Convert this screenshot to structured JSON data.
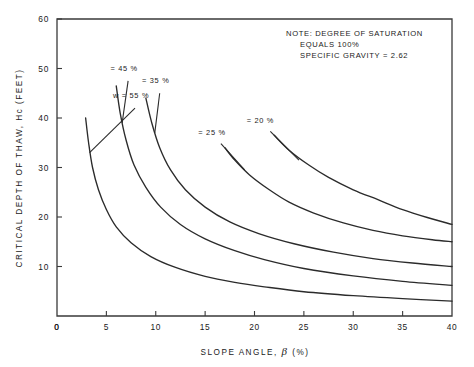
{
  "chart_data": {
    "type": "line",
    "title": "",
    "xlabel": "SLOPE ANGLE, β (%)",
    "ylabel": "CRITICAL DEPTH OF THAW, Hc (FEET)",
    "xlim": [
      0,
      40
    ],
    "ylim": [
      0,
      60
    ],
    "xticks": [
      0,
      5,
      10,
      15,
      20,
      25,
      30,
      35,
      40
    ],
    "xticklabels": [
      "0",
      "5",
      "10",
      "15",
      "20",
      "25",
      "30",
      "35",
      "40"
    ],
    "yticks": [
      0,
      10,
      20,
      30,
      40,
      50,
      60
    ],
    "yticklabels": [
      "0",
      "10",
      "20",
      "30",
      "40",
      "50",
      "60"
    ],
    "grid": false,
    "legend_position": "inline-curve-labels",
    "annotations": [
      "NOTE: DEGREE OF SATURATION",
      "EQUALS 100%",
      "SPECIFIC GRAVITY = 2.62"
    ],
    "series": [
      {
        "name": "w=55 %",
        "label": "w = 55 %",
        "label_x": 7.5,
        "label_y": 44.0,
        "points": [
          [
            2.9,
            40.0
          ],
          [
            3.2,
            35.0
          ],
          [
            3.6,
            30.0
          ],
          [
            4.2,
            25.5
          ],
          [
            5.0,
            21.5
          ],
          [
            6.0,
            18.0
          ],
          [
            7.5,
            14.8
          ],
          [
            9.5,
            12.0
          ],
          [
            12.0,
            9.8
          ],
          [
            15.0,
            8.0
          ],
          [
            18.0,
            6.8
          ],
          [
            21.0,
            5.9
          ],
          [
            25.0,
            4.9
          ],
          [
            30.0,
            4.1
          ],
          [
            35.0,
            3.5
          ],
          [
            40.0,
            3.0
          ]
        ]
      },
      {
        "name": "=45 %",
        "label": "= 45 %",
        "label_x": 6.8,
        "label_y": 49.5,
        "points": [
          [
            6.0,
            46.5
          ],
          [
            6.4,
            41.0
          ],
          [
            7.0,
            35.5
          ],
          [
            7.8,
            30.5
          ],
          [
            9.0,
            26.0
          ],
          [
            10.5,
            22.0
          ],
          [
            12.5,
            18.5
          ],
          [
            15.0,
            15.6
          ],
          [
            18.0,
            13.2
          ],
          [
            21.0,
            11.4
          ],
          [
            25.0,
            9.6
          ],
          [
            30.0,
            8.1
          ],
          [
            35.0,
            7.0
          ],
          [
            40.0,
            6.2
          ]
        ]
      },
      {
        "name": "=35 %",
        "label": "= 35 %",
        "label_x": 10.0,
        "label_y": 47.0,
        "points": [
          [
            9.0,
            44.0
          ],
          [
            9.6,
            39.0
          ],
          [
            10.4,
            34.0
          ],
          [
            11.5,
            29.5
          ],
          [
            13.0,
            25.5
          ],
          [
            15.0,
            22.0
          ],
          [
            17.5,
            19.0
          ],
          [
            20.5,
            16.6
          ],
          [
            24.0,
            14.6
          ],
          [
            28.0,
            12.9
          ],
          [
            32.0,
            11.6
          ],
          [
            36.0,
            10.7
          ],
          [
            40.0,
            10.0
          ]
        ]
      },
      {
        "name": "=25 %",
        "label": "= 25 %",
        "label_x": 15.7,
        "label_y": 36.5,
        "points": [
          [
            17.0,
            34.0
          ],
          [
            18.0,
            31.5
          ],
          [
            19.5,
            28.5
          ],
          [
            21.5,
            25.5
          ],
          [
            23.5,
            23.0
          ],
          [
            26.0,
            20.8
          ],
          [
            29.0,
            18.8
          ],
          [
            32.0,
            17.3
          ],
          [
            35.0,
            16.2
          ],
          [
            38.0,
            15.4
          ],
          [
            40.0,
            15.0
          ]
        ]
      },
      {
        "name": "=20 %",
        "label": "= 20 %",
        "label_x": 20.6,
        "label_y": 39.0,
        "points": [
          [
            22.0,
            36.5
          ],
          [
            23.5,
            33.5
          ],
          [
            25.5,
            30.5
          ],
          [
            27.5,
            28.0
          ],
          [
            30.0,
            25.5
          ],
          [
            32.5,
            23.5
          ],
          [
            35.0,
            21.5
          ],
          [
            37.5,
            19.9
          ],
          [
            40.0,
            18.5
          ]
        ]
      }
    ],
    "label_leaders": [
      {
        "name": "leader-55",
        "from_x": 7.9,
        "from_y": 42.0,
        "to_x": 3.3,
        "to_y": 33.0
      },
      {
        "name": "leader-45",
        "from_x": 7.2,
        "from_y": 47.5,
        "to_x": 6.6,
        "to_y": 39.0
      },
      {
        "name": "leader-35",
        "from_x": 10.4,
        "from_y": 45.0,
        "to_x": 9.9,
        "to_y": 37.0
      },
      {
        "name": "leader-25",
        "from_x": 16.6,
        "from_y": 34.8,
        "to_x": 19.0,
        "to_y": 29.5
      },
      {
        "name": "leader-20",
        "from_x": 21.6,
        "from_y": 37.3,
        "to_x": 24.5,
        "to_y": 31.5
      }
    ]
  }
}
